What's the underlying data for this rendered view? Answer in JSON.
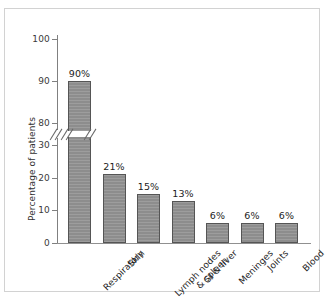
{
  "chart_data": {
    "type": "bar",
    "title": "",
    "xlabel": "",
    "ylabel": "Percentage of patients",
    "categories": [
      "Respiratory",
      "Skin",
      "Lymph nodes\n& spleen",
      "GI & liver",
      "Meninges",
      "Joints",
      "Blood"
    ],
    "category_lines": [
      [
        "Respiratory"
      ],
      [
        "Skin"
      ],
      [
        "Lymph nodes",
        "& spleen"
      ],
      [
        "GI & liver"
      ],
      [
        "Meninges"
      ],
      [
        "Joints"
      ],
      [
        "Blood"
      ]
    ],
    "values": [
      90,
      21,
      15,
      13,
      6,
      6,
      6
    ],
    "data_labels": [
      "90%",
      "21%",
      "15%",
      "13%",
      "6%",
      "6%",
      "6%"
    ],
    "ytick_labels": [
      "0",
      "10",
      "20",
      "30",
      "80",
      "90",
      "100"
    ],
    "ytick_values": [
      0,
      10,
      20,
      30,
      80,
      90,
      100
    ],
    "ylim": [
      0,
      100
    ],
    "axis_break": {
      "present": true,
      "between": [
        30,
        80
      ],
      "style": "double-slash"
    },
    "grid": false,
    "legend": null,
    "bar_color": "#8d8d8d",
    "bar_edge_color": "#555555",
    "axis_color": "#808080",
    "text_color": "#1f1f1f",
    "frame_color": "#d2d2d2",
    "background_color": "#ffffff"
  }
}
